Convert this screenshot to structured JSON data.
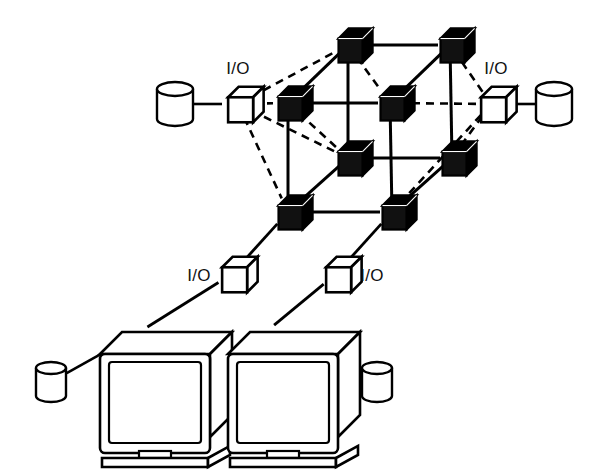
{
  "figure": {
    "background_color": "#ffffff",
    "ink_color": "#000000",
    "node_fill": "#111111",
    "io_fill": "#ffffff"
  },
  "labels": {
    "io_top_left": "I/O",
    "io_top_right": "I/O",
    "io_bottom_left": "I/O",
    "io_bottom_right": "I/O"
  },
  "nodes": [
    {
      "id": "n-back-top-left",
      "name": "processor-node-back-top-left",
      "x": 348,
      "y": 45,
      "size": 24,
      "style": "filled"
    },
    {
      "id": "n-back-top-right",
      "name": "processor-node-back-top-right",
      "x": 450,
      "y": 45,
      "size": 24,
      "style": "filled"
    },
    {
      "id": "n-front-top-left",
      "name": "processor-node-front-top-left",
      "x": 288,
      "y": 103,
      "size": 24,
      "style": "filled"
    },
    {
      "id": "n-front-top-right",
      "name": "processor-node-center-right",
      "x": 390,
      "y": 103,
      "size": 24,
      "style": "filled"
    },
    {
      "id": "n-mid-left",
      "name": "processor-node-mid-left",
      "x": 348,
      "y": 158,
      "size": 24,
      "style": "filled"
    },
    {
      "id": "n-mid-right",
      "name": "processor-node-mid-right",
      "x": 452,
      "y": 158,
      "size": 24,
      "style": "filled"
    },
    {
      "id": "n-bottom-left",
      "name": "processor-node-bottom-left",
      "x": 288,
      "y": 212,
      "size": 24,
      "style": "filled"
    },
    {
      "id": "n-bottom-right",
      "name": "processor-node-bottom-right",
      "x": 392,
      "y": 212,
      "size": 24,
      "style": "filled"
    }
  ],
  "io_cubes": [
    {
      "id": "io-left",
      "name": "io-cube-left",
      "x": 238,
      "y": 104,
      "size": 25,
      "label_x": 238,
      "label_y": 74,
      "label_anchor": "middle"
    },
    {
      "id": "io-right",
      "name": "io-cube-right",
      "x": 491,
      "y": 104,
      "size": 25,
      "label_x": 496,
      "label_y": 74,
      "label_anchor": "middle"
    },
    {
      "id": "io-lower-left",
      "name": "io-cube-lower-left",
      "x": 232,
      "y": 274,
      "size": 25,
      "label_x": 199,
      "label_y": 281,
      "label_anchor": "middle"
    },
    {
      "id": "io-lower-right",
      "name": "io-cube-lower-right",
      "x": 336,
      "y": 274,
      "size": 25,
      "label_x": 372,
      "label_y": 281,
      "label_anchor": "middle"
    }
  ],
  "disks": [
    {
      "id": "disk-top-left",
      "name": "disk-top-left",
      "cx": 175,
      "cy": 104,
      "rx": 18,
      "ry": 7,
      "body": 30
    },
    {
      "id": "disk-top-right",
      "name": "disk-top-right",
      "cx": 554,
      "cy": 104,
      "rx": 18,
      "ry": 7,
      "body": 30
    },
    {
      "id": "disk-workstation-left",
      "name": "disk-workstation-left",
      "cx": 51,
      "cy": 382,
      "rx": 15,
      "ry": 6,
      "body": 28
    },
    {
      "id": "disk-workstation-right",
      "name": "disk-workstation-right",
      "cx": 377,
      "cy": 382,
      "rx": 15,
      "ry": 6,
      "body": 28
    }
  ],
  "workstations": [
    {
      "id": "ws-left",
      "name": "workstation-left",
      "x": 100,
      "y": 332,
      "w": 110,
      "h": 105
    },
    {
      "id": "ws-right",
      "name": "workstation-right",
      "x": 228,
      "y": 332,
      "w": 110,
      "h": 105
    }
  ],
  "links": {
    "solid": [
      {
        "from": "n-back-top-left",
        "to": "n-back-top-right",
        "name": "link-back-top-horizontal"
      },
      {
        "from": "n-front-top-left",
        "to": "n-front-top-right",
        "name": "link-front-top-horizontal"
      },
      {
        "from": "n-mid-left",
        "to": "n-mid-right",
        "name": "link-mid-horizontal"
      },
      {
        "from": "n-bottom-left",
        "to": "n-bottom-right",
        "name": "link-bottom-horizontal"
      },
      {
        "from": "n-back-top-left",
        "to": "n-mid-left",
        "name": "link-back-left-vertical"
      },
      {
        "from": "n-back-top-right",
        "to": "n-mid-right",
        "name": "link-back-right-vertical"
      },
      {
        "from": "n-front-top-left",
        "to": "n-bottom-left",
        "name": "link-front-left-vertical"
      },
      {
        "from": "n-front-top-right",
        "to": "n-bottom-right",
        "name": "link-front-right-vertical"
      },
      {
        "from": "n-front-top-left",
        "to": "n-back-top-left",
        "name": "link-depth-top-left"
      },
      {
        "from": "n-front-top-right",
        "to": "n-back-top-right",
        "name": "link-depth-top-right"
      },
      {
        "from": "n-bottom-left",
        "to": "n-mid-left",
        "name": "link-depth-bottom-left"
      },
      {
        "from": "n-bottom-right",
        "to": "n-mid-right",
        "name": "link-depth-bottom-right"
      }
    ],
    "dashed": [
      {
        "from": "io-left",
        "to": "n-back-top-left",
        "name": "link-io-left-to-back-top-left"
      },
      {
        "from": "io-left",
        "to": "n-front-top-left",
        "name": "link-io-left-to-front-top-left"
      },
      {
        "from": "io-left",
        "to": "n-mid-left",
        "name": "link-io-left-to-mid-left"
      },
      {
        "from": "io-left",
        "to": "n-bottom-left",
        "name": "link-io-left-to-bottom-left"
      },
      {
        "from": "io-right",
        "to": "n-back-top-right",
        "name": "link-io-right-to-back-top-right"
      },
      {
        "from": "io-right",
        "to": "n-front-top-right",
        "name": "link-io-right-to-center-right"
      },
      {
        "from": "io-right",
        "to": "n-mid-right",
        "name": "link-io-right-to-mid-right"
      },
      {
        "from": "io-right",
        "to": "n-bottom-right",
        "name": "link-io-right-to-bottom-right"
      },
      {
        "from": "n-front-top-left",
        "to": "n-mid-left",
        "name": "link-diag-front-left-mid"
      },
      {
        "from": "n-back-top-left",
        "to": "n-front-top-right",
        "name": "link-diag-back-left-center"
      }
    ],
    "drops": [
      {
        "from": "n-bottom-left",
        "to": "io-lower-left",
        "name": "link-bottom-left-to-io-lower-left"
      },
      {
        "from": "n-bottom-right",
        "to": "io-lower-right",
        "name": "link-bottom-right-to-io-lower-right"
      },
      {
        "from": "io-lower-left",
        "to": "ws-left",
        "name": "link-io-lower-left-to-workstation-left"
      },
      {
        "from": "io-lower-right",
        "to": "ws-right",
        "name": "link-io-lower-right-to-workstation-right"
      }
    ],
    "disk_cables": [
      {
        "from": "disk-top-left",
        "to": "io-left",
        "name": "cable-disk-to-io-left"
      },
      {
        "from": "disk-top-right",
        "to": "io-right",
        "name": "cable-disk-to-io-right"
      },
      {
        "from": "disk-workstation-left",
        "to": "ws-left",
        "name": "cable-disk-to-workstation-left"
      },
      {
        "from": "disk-workstation-right",
        "to": "ws-right",
        "name": "cable-disk-to-workstation-right"
      }
    ]
  }
}
